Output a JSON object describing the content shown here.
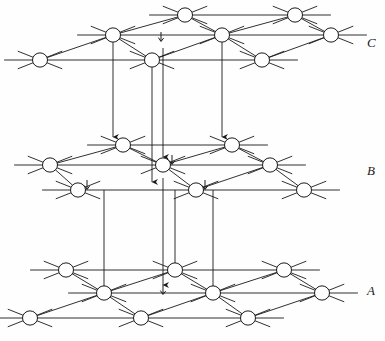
{
  "figure": {
    "background_color": "#fefefe",
    "line_color": "#1a1a1a",
    "node_fill": "#ffffff",
    "node_stroke": "#1a1a1a",
    "node_radius": 7.5,
    "stub_length": 16
  },
  "layer_labels": [
    {
      "text": "C",
      "x": 367,
      "y": 36
    },
    {
      "text": "B",
      "x": 367,
      "y": 164
    },
    {
      "text": "A",
      "x": 367,
      "y": 284
    }
  ],
  "layers": [
    {
      "name": "C",
      "label": "C",
      "rows": [
        {
          "row": "back",
          "y": 15,
          "nodes": [
            {
              "x": 185
            },
            {
              "x": 295
            }
          ]
        },
        {
          "row": "middle",
          "y": 35,
          "nodes": [
            {
              "x": 113
            },
            {
              "x": 222
            },
            {
              "x": 331
            }
          ]
        },
        {
          "row": "front",
          "y": 60,
          "nodes": [
            {
              "x": 40
            },
            {
              "x": 152
            },
            {
              "x": 262
            }
          ]
        }
      ]
    },
    {
      "name": "B",
      "label": "B",
      "rows": [
        {
          "row": "back",
          "y": 145,
          "nodes": [
            {
              "x": 123
            },
            {
              "x": 232
            }
          ]
        },
        {
          "row": "middle",
          "y": 165,
          "nodes": [
            {
              "x": 50
            },
            {
              "x": 163
            },
            {
              "x": 270
            }
          ]
        },
        {
          "row": "front",
          "y": 190,
          "nodes": [
            {
              "x": 78
            },
            {
              "x": 196
            },
            {
              "x": 304
            }
          ]
        }
      ]
    },
    {
      "name": "A",
      "label": "A",
      "rows": [
        {
          "row": "back",
          "y": 270,
          "nodes": [
            {
              "x": 66
            },
            {
              "x": 175
            },
            {
              "x": 284
            }
          ]
        },
        {
          "row": "middle",
          "y": 293,
          "nodes": [
            {
              "x": 104
            },
            {
              "x": 213
            },
            {
              "x": 322
            }
          ]
        },
        {
          "row": "front",
          "y": 318,
          "nodes": [
            {
              "x": 30
            },
            {
              "x": 141
            },
            {
              "x": 248
            }
          ]
        }
      ]
    }
  ],
  "vertical_lines": [
    {
      "x_top": 113,
      "y_top": 35,
      "x_bottom": 113,
      "y_bottom": 145,
      "arrow": true
    },
    {
      "x_top": 152,
      "y_top": 60,
      "x_bottom": 152,
      "y_bottom": 190,
      "arrow": true
    },
    {
      "x_top": 163,
      "y_top": 48,
      "x_bottom": 163,
      "y_bottom": 165,
      "arrow": true
    },
    {
      "x_top": 222,
      "y_top": 35,
      "x_bottom": 222,
      "y_bottom": 145,
      "arrow": true
    },
    {
      "x_top": 104,
      "y_top": 190,
      "x_bottom": 104,
      "y_bottom": 293,
      "arrow": false
    },
    {
      "x_top": 163,
      "y_top": 178,
      "x_bottom": 163,
      "y_bottom": 293,
      "arrow": true
    },
    {
      "x_top": 175,
      "y_top": 190,
      "x_bottom": 175,
      "y_bottom": 270,
      "arrow": false
    },
    {
      "x_top": 213,
      "y_top": 190,
      "x_bottom": 213,
      "y_bottom": 293,
      "arrow": false
    }
  ],
  "node_arrows": [
    {
      "x": 161,
      "y": 32,
      "note": "arrow above C front node"
    },
    {
      "x": 122,
      "y": 142,
      "note": "arrow at B back node"
    },
    {
      "x": 231,
      "y": 142,
      "note": "arrow at B back node right"
    },
    {
      "x": 172,
      "y": 155,
      "note": "arrow at B middle node"
    },
    {
      "x": 87,
      "y": 180,
      "note": "arrow at B front node"
    },
    {
      "x": 205,
      "y": 180,
      "note": "arrow at B front node right"
    },
    {
      "x": 163,
      "y": 285,
      "note": "arrow at A middle node"
    }
  ]
}
